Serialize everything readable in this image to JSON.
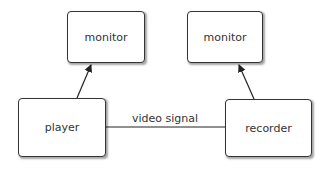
{
  "diagram": {
    "nodes": [
      {
        "id": "monitor_left",
        "label": "monitor",
        "x": 67,
        "y": 11,
        "w": 78,
        "h": 52
      },
      {
        "id": "monitor_right",
        "label": "monitor",
        "x": 187,
        "y": 11,
        "w": 76,
        "h": 52
      },
      {
        "id": "player",
        "label": "player",
        "x": 18,
        "y": 98,
        "w": 88,
        "h": 59
      },
      {
        "id": "recorder",
        "label": "recorder",
        "x": 225,
        "y": 99,
        "w": 87,
        "h": 58
      }
    ],
    "edges": [
      {
        "from": "player",
        "to": "monitor_left",
        "arrow": true
      },
      {
        "from": "recorder",
        "to": "monitor_right",
        "arrow": true
      },
      {
        "from": "player",
        "to": "recorder",
        "arrow": false,
        "label": "video signal"
      }
    ],
    "edge_label": "video signal",
    "colors": {
      "stroke": "#333333",
      "fill": "#ffffff"
    }
  }
}
